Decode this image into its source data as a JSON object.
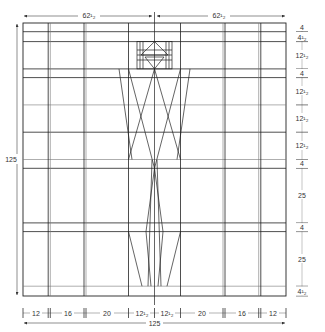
{
  "diagram": {
    "type": "technical grid drawing",
    "overall": {
      "width": 125,
      "height": 125
    },
    "top_dimensions": [
      {
        "label": "62¹₂",
        "value": 62.5
      },
      {
        "label": "62¹₂",
        "value": 62.5
      }
    ],
    "left_dimension": {
      "label": "125",
      "value": 125
    },
    "bottom_total": {
      "label": "125",
      "value": 125
    },
    "bottom_dimensions": [
      {
        "label": "12",
        "value": 12
      },
      {
        "label": "16",
        "value": 16
      },
      {
        "label": "20",
        "value": 20
      },
      {
        "label": "12¹₂",
        "value": 12.5
      },
      {
        "label": "12¹₂",
        "value": 12.5
      },
      {
        "label": "20",
        "value": 20
      },
      {
        "label": "16",
        "value": 16
      },
      {
        "label": "12",
        "value": 12
      }
    ],
    "right_dimensions": [
      {
        "label": "4",
        "value": 4
      },
      {
        "label": "4¹₂",
        "value": 4.5
      },
      {
        "label": "12¹₂",
        "value": 12.5
      },
      {
        "label": "4",
        "value": 4
      },
      {
        "label": "12¹₂",
        "value": 12.5
      },
      {
        "label": "12¹₂",
        "value": 12.5
      },
      {
        "label": "12¹₂",
        "value": 12.5
      },
      {
        "label": "4",
        "value": 4
      },
      {
        "label": "25",
        "value": 25
      },
      {
        "label": "4",
        "value": 4
      },
      {
        "label": "25",
        "value": 25
      },
      {
        "label": "4¹₂",
        "value": 4.5
      }
    ],
    "colors": {
      "line": "#222222",
      "dim_line": "#555555",
      "background": "#ffffff"
    }
  }
}
